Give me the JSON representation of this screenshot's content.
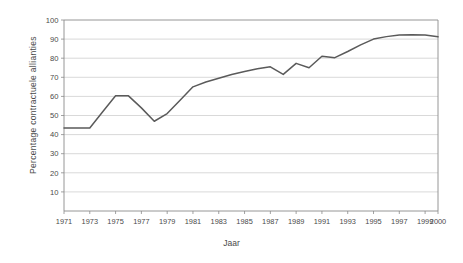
{
  "chart_data": {
    "type": "line",
    "title": "",
    "xlabel": "Jaar",
    "ylabel": "Percentage  contractuele  allianties",
    "ylim": [
      0,
      100
    ],
    "xlim": [
      1971,
      2000
    ],
    "grid": true,
    "legend": false,
    "y_ticks": [
      10,
      20,
      30,
      40,
      50,
      60,
      70,
      80,
      90,
      100
    ],
    "x_tick_labels": [
      "1971",
      "1973",
      "1975",
      "1977",
      "1979",
      "1981",
      "1983",
      "1985",
      "1987",
      "1989",
      "1991",
      "1993",
      "1995",
      "1997",
      "1999",
      "2000"
    ],
    "x": [
      1971,
      1972,
      1973,
      1974,
      1975,
      1976,
      1977,
      1978,
      1979,
      1980,
      1981,
      1982,
      1983,
      1984,
      1985,
      1986,
      1987,
      1988,
      1989,
      1990,
      1991,
      1992,
      1993,
      1994,
      1995,
      1996,
      1997,
      1998,
      1999,
      2000
    ],
    "values": [
      43.5,
      43.5,
      43.5,
      52.0,
      60.3,
      60.3,
      54.0,
      47.0,
      51.0,
      58.0,
      65.0,
      67.5,
      69.5,
      71.5,
      73.0,
      74.5,
      75.5,
      71.5,
      77.3,
      75.0,
      81.0,
      80.3,
      83.5,
      87.0,
      90.0,
      91.3,
      92.2,
      92.3,
      92.2,
      91.2
    ],
    "series": [
      {
        "name": "Percentage contractuele allianties",
        "color": "#5a5a5a",
        "values": [
          43.5,
          43.5,
          43.5,
          52.0,
          60.3,
          60.3,
          54.0,
          47.0,
          51.0,
          58.0,
          65.0,
          67.5,
          69.5,
          71.5,
          73.0,
          74.5,
          75.5,
          71.5,
          77.3,
          75.0,
          81.0,
          80.3,
          83.5,
          87.0,
          90.0,
          91.3,
          92.2,
          92.3,
          92.2,
          91.2
        ]
      }
    ]
  }
}
